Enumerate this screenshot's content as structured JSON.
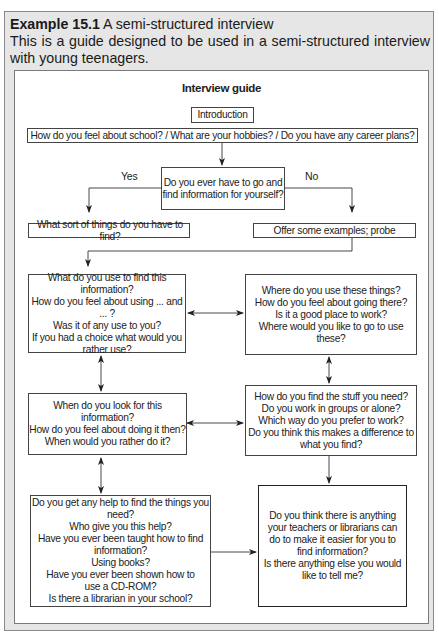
{
  "example": {
    "number": "Example 15.1",
    "title": " A semi-structured interview",
    "description": "This is a guide designed to be used in a semi-structured interview with young teenagers."
  },
  "guide": {
    "title": "Interview guide",
    "introduction": "Introduction",
    "opening": "How do you feel about school? / What are your hobbies? / Do you have any career plans?",
    "decision": "Do you ever have to go and\nfind information for yourself?",
    "yes_label": "Yes",
    "no_label": "No",
    "yes_branch": "What sort of things do you have to find?",
    "no_branch": "Offer some examples; probe",
    "boxes": {
      "what_use": "What do you use to find this\ninformation?\nHow do you feel about using ... and ... ?\nWas it of any use to you?\nIf you had a choice what would you\nrather use?",
      "where_use": "Where do you use these things?\nHow do you feel about going there?\nIs it a good place to work?\nWhere would you like to go to use these?",
      "when_look": "When do you look for this information?\nHow do you feel about doing it then?\nWhen would you rather do it?",
      "how_find": "How do you find the stuff you need?\nDo you work in groups or alone?\nWhich way do you prefer to work?\nDo you think this makes a difference to\nwhat you find?",
      "help": "Do you get any help to find the things you\nneed?\nWho give you this help?\nHave you ever been taught how to find\ninformation?\nUsing books?\nHave you ever been shown how to\nuse a CD-ROM?\nIs there a librarian in your school?",
      "final": "Do you think there is anything\nyour teachers or librarians can\ndo to make it easier for you to\nfind information?\nIs there anything else you would\nlike to tell me?"
    }
  }
}
